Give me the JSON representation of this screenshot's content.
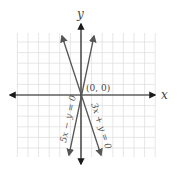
{
  "chart_data": {
    "type": "line",
    "title": "",
    "xlabel": "x",
    "ylabel": "y",
    "xlim": [
      -6,
      6
    ],
    "ylim": [
      -6,
      6
    ],
    "grid": true,
    "series": [
      {
        "name": "5x − y = 0",
        "equation": "y = 5x",
        "points": [
          [
            -1.2,
            -6
          ],
          [
            0,
            0
          ],
          [
            1.2,
            6
          ]
        ]
      },
      {
        "name": "3x + y = 0",
        "equation": "y = -3x",
        "points": [
          [
            -2,
            6
          ],
          [
            0,
            0
          ],
          [
            2,
            -6
          ]
        ]
      }
    ],
    "annotations": [
      {
        "text": "(0, 0)",
        "x": 0,
        "y": 0
      }
    ]
  },
  "labels": {
    "x_axis": "x",
    "y_axis": "y",
    "origin": "(0, 0)",
    "line1": "5x − y = 0",
    "line2": "3x + y = 0"
  },
  "colors": {
    "axis": "#1a1a1a",
    "line": "#555555",
    "grid": "#dddddd",
    "text": "#444444"
  }
}
